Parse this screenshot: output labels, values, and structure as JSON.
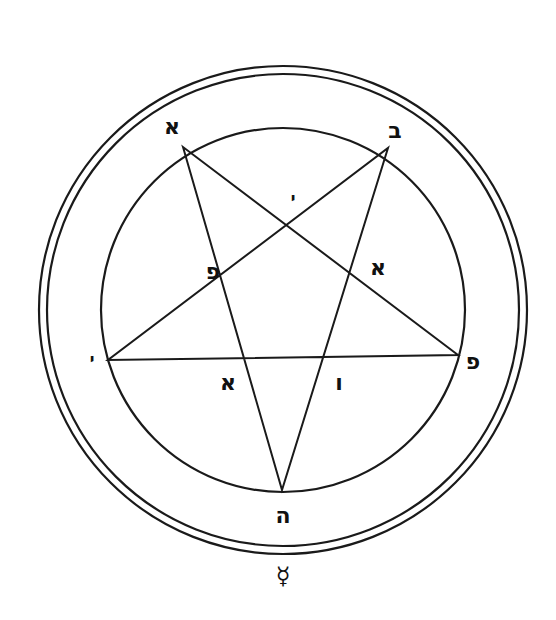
{
  "figure": {
    "type": "pentacle",
    "stroke_color": "#1a1a1a",
    "background": "#ffffff",
    "outer_circles": {
      "cx": 283,
      "cy": 310,
      "radii": [
        244,
        236
      ]
    },
    "inner_circle": {
      "cx": 283,
      "cy": 310,
      "r": 182
    },
    "star_points": [
      {
        "name": "top-left",
        "x": 183,
        "y": 147
      },
      {
        "name": "top-right",
        "x": 388,
        "y": 148
      },
      {
        "name": "right",
        "x": 458,
        "y": 355
      },
      {
        "name": "bottom",
        "x": 282,
        "y": 490
      },
      {
        "name": "left",
        "x": 108,
        "y": 360
      }
    ]
  },
  "labels": [
    {
      "id": "aleph-top-left",
      "text": "א",
      "x": 172,
      "y": 127,
      "size": "big"
    },
    {
      "id": "bet-top-right",
      "text": "ב",
      "x": 395,
      "y": 131,
      "size": "big"
    },
    {
      "id": "yod-top-center",
      "text": "י",
      "x": 293,
      "y": 199,
      "size": "small"
    },
    {
      "id": "pe-left-inner",
      "text": "פ",
      "x": 213,
      "y": 272,
      "size": "big"
    },
    {
      "id": "aleph-right-inner",
      "text": "א",
      "x": 378,
      "y": 268,
      "size": "big"
    },
    {
      "id": "yod-left-outer",
      "text": "י",
      "x": 92,
      "y": 360,
      "size": "small"
    },
    {
      "id": "aleph-bottom-left",
      "text": "א",
      "x": 228,
      "y": 383,
      "size": "big"
    },
    {
      "id": "vav-bottom-right",
      "text": "ו",
      "x": 339,
      "y": 383,
      "size": "big"
    },
    {
      "id": "pe-right-outer",
      "text": "פ",
      "x": 473,
      "y": 362,
      "size": "big"
    },
    {
      "id": "he-bottom",
      "text": "ה",
      "x": 283,
      "y": 516,
      "size": "big"
    },
    {
      "id": "mercury-symbol",
      "text": "☿",
      "x": 283,
      "y": 576,
      "size": "symbol"
    }
  ]
}
